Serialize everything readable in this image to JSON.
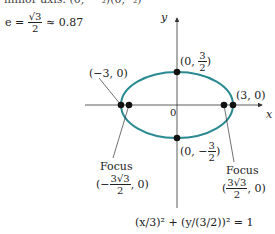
{
  "header": {
    "top_cut_text": "minor axis: (0, −³₂)(0, ³₂)",
    "eccentricity_lhs": "e =",
    "eccentricity_num": "√3",
    "eccentricity_den": "2",
    "eccentricity_rhs": "≈ 0.87"
  },
  "axes": {
    "x_label": "x",
    "y_label": "y",
    "origin_label": "0"
  },
  "points": {
    "top": {
      "prefix": "(0,",
      "num": "3",
      "den": "2",
      "suffix": ")"
    },
    "bottom": {
      "prefix": "(0, −",
      "num": "3",
      "den": "2",
      "suffix": ")"
    },
    "left_vertex": "(−3, 0)",
    "right_vertex": "(3, 0)"
  },
  "foci": {
    "left": {
      "title": "Focus",
      "prefix": "(−",
      "num": "3√3",
      "den": "2",
      "suffix": ", 0)"
    },
    "right": {
      "title": "Focus",
      "prefix": "(",
      "num": "3√3",
      "den": "2",
      "suffix": ", 0)"
    }
  },
  "equation": "(x/3)² + (y/(3/2))² = 1",
  "colors": {
    "ellipse": "#2a8a92",
    "axis": "#333333",
    "point": "#111111"
  }
}
